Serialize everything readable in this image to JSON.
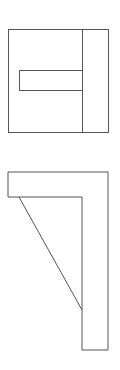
{
  "canvas": {
    "width": 120,
    "height": 370,
    "background": "#ffffff"
  },
  "colors": {
    "stroke": "#555555"
  },
  "top_view": {
    "outer_rect": {
      "x": 8,
      "y": 29,
      "w": 100,
      "h": 103
    },
    "divider_x": 82,
    "inner_slot": {
      "x": 19,
      "y": 70,
      "w": 63,
      "h": 20
    }
  },
  "front_view": {
    "outline_points": "8,172 108,172 108,350 82,350 82,197 8,197",
    "diagonal": {
      "x1": 19,
      "y1": 197,
      "x2": 82,
      "y2": 310
    }
  }
}
